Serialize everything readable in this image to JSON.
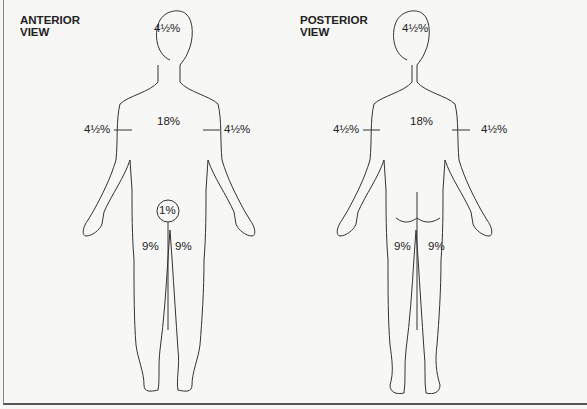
{
  "anterior": {
    "title_line1": "ANTERIOR",
    "title_line2": "VIEW",
    "head": "4½%",
    "trunk": "18%",
    "right_arm": "4½%",
    "left_arm": "4½%",
    "genitalia": "1%",
    "right_leg": "9%",
    "left_leg": "9%"
  },
  "posterior": {
    "title_line1": "POSTERIOR",
    "title_line2": "VIEW",
    "head": "4½%",
    "trunk": "18%",
    "left_arm": "4½%",
    "right_arm": "4½%",
    "left_leg": "9%",
    "right_leg": "9%"
  }
}
